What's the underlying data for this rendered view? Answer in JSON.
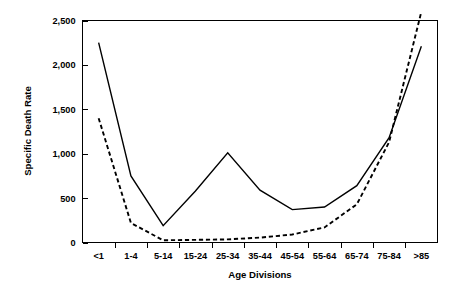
{
  "chart_data": {
    "type": "line",
    "title": "",
    "xlabel": "Age Divisions",
    "ylabel": "Specific Death Rate",
    "categories": [
      "<1",
      "1-4",
      "5-14",
      "15-24",
      "25-34",
      "35-44",
      "45-54",
      "55-64",
      "65-74",
      "75-84",
      ">85"
    ],
    "ytick_labels": [
      "0",
      "500",
      "1,000",
      "1,500",
      "2,000",
      "2,500"
    ],
    "ytick_values": [
      0,
      500,
      1000,
      1500,
      2000,
      2500
    ],
    "ylim": [
      0,
      2500
    ],
    "grid": false,
    "legend": "none",
    "series": [
      {
        "name": "solid",
        "style": "solid",
        "color": "#000000",
        "values": [
          2250,
          750,
          190,
          580,
          1010,
          590,
          370,
          400,
          640,
          1180,
          2210
        ]
      },
      {
        "name": "dashed",
        "style": "dashed",
        "color": "#000000",
        "values": [
          1400,
          220,
          25,
          30,
          35,
          55,
          90,
          170,
          430,
          1130,
          2600
        ]
      }
    ],
    "notes": {
      "dashed_exceeds_axis_top": "true",
      "crossover_between": "65-74 and 75-84"
    }
  },
  "axes": {
    "y_axis_title": "Specific Death Rate",
    "x_axis_title": "Age Divisions"
  }
}
